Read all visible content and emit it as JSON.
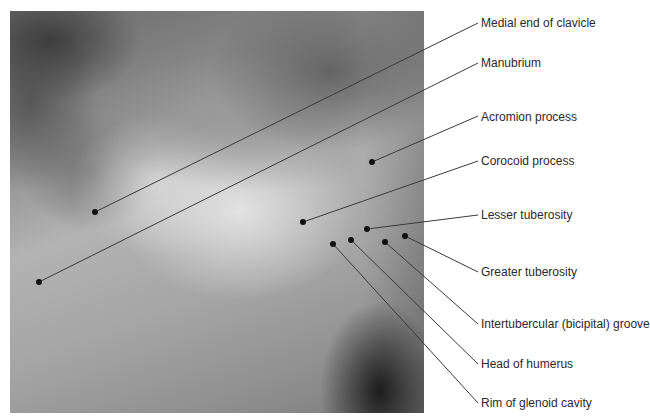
{
  "figure": {
    "type": "anatomical-photo"
  },
  "labels": [
    {
      "text": "Medial end of clavicle",
      "dot": [
        95,
        212
      ],
      "end": [
        478,
        23
      ],
      "y": 16
    },
    {
      "text": "Manubrium",
      "dot": [
        39,
        282
      ],
      "end": [
        478,
        63
      ],
      "y": 56
    },
    {
      "text": "Acromion process",
      "dot": [
        372,
        162
      ],
      "end": [
        478,
        116
      ],
      "y": 110
    },
    {
      "text": "Corocoid process",
      "dot": [
        303,
        222
      ],
      "end": [
        478,
        161
      ],
      "y": 154
    },
    {
      "text": "Lesser tuberosity",
      "dot": [
        367,
        229
      ],
      "end": [
        478,
        215
      ],
      "y": 208
    },
    {
      "text": "Greater tuberosity",
      "dot": [
        405,
        236
      ],
      "end": [
        478,
        272
      ],
      "y": 265
    },
    {
      "text": "Intertubercular (bicipital) groove",
      "dot": [
        385,
        242
      ],
      "end": [
        478,
        324
      ],
      "y": 317
    },
    {
      "text": "Head of humerus",
      "dot": [
        351,
        240
      ],
      "end": [
        478,
        364
      ],
      "y": 357
    },
    {
      "text": "Rim of glenoid cavity",
      "dot": [
        333,
        244
      ],
      "end": [
        478,
        403
      ],
      "y": 396
    }
  ],
  "colors": {
    "leader_line": "#3a3a3a",
    "dot": "#111111",
    "label_text": "#2a2a2a"
  }
}
